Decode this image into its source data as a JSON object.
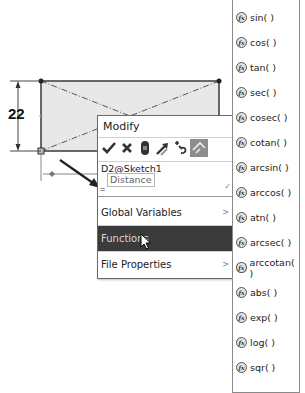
{
  "sketch": {
    "dimension_value": "22",
    "fill_color": "#e8e8e8",
    "line_color": "#333333"
  },
  "modify_dialog": {
    "title": "Modify",
    "toolbar": [
      {
        "name": "ok",
        "icon": "check-icon",
        "glyph": "✔"
      },
      {
        "name": "cancel",
        "icon": "close-icon",
        "glyph": "✖"
      },
      {
        "name": "regenerate",
        "icon": "regenerate-icon",
        "glyph": ""
      },
      {
        "name": "reverse-sense",
        "icon": "reverse-dimension-icon",
        "glyph": ""
      },
      {
        "name": "mark-for-drawing",
        "icon": "link-value-icon",
        "glyph": ""
      },
      {
        "name": "reset-spin",
        "icon": "dimension-reference-icon",
        "glyph": "",
        "active": true
      }
    ],
    "dimension_name": "D2@Sketch1",
    "tooltip": "Distance",
    "input": {
      "value": "=",
      "placeholder": ""
    },
    "menu": [
      {
        "label": "Global Variables",
        "has_submenu": true,
        "highlighted": false
      },
      {
        "label": "Functions",
        "has_submenu": true,
        "highlighted": true
      },
      {
        "label": "File Properties",
        "has_submenu": true,
        "highlighted": false
      }
    ],
    "submenu_arrow": ">",
    "input_chevron": "✓"
  },
  "functions_menu": {
    "icon_label": "fx",
    "items": [
      "sin( )",
      "cos( )",
      "tan( )",
      "sec( )",
      "cosec( )",
      "cotan( )",
      "arcsin( )",
      "arccos( )",
      "atn( )",
      "arcsec( )",
      "arccotan( )",
      "abs( )",
      "exp( )",
      "log( )",
      "sqr( )"
    ]
  },
  "colors": {
    "highlight": "#3b3b3b",
    "highlight_text": "#d8d8d8",
    "active_tool": "#8d8d8d"
  }
}
